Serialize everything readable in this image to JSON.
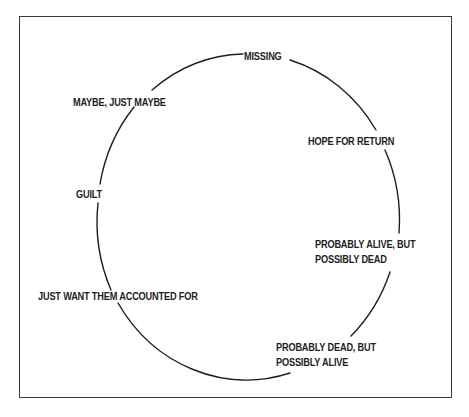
{
  "diagram": {
    "type": "cycle",
    "stroke_color": "#1e1e1e",
    "border_color": "#3a3a3a",
    "stages": [
      {
        "id": "missing",
        "lines": [
          "MISSING"
        ]
      },
      {
        "id": "hope-for-return",
        "lines": [
          "HOPE FOR RETURN"
        ]
      },
      {
        "id": "probably-alive",
        "lines": [
          "PROBABLY ALIVE, BUT",
          "POSSIBLY DEAD"
        ]
      },
      {
        "id": "probably-dead",
        "lines": [
          "PROBABLY DEAD, BUT",
          "POSSIBLY ALIVE"
        ]
      },
      {
        "id": "just-want-accounted",
        "lines": [
          "JUST WANT THEM ACCOUNTED FOR"
        ]
      },
      {
        "id": "guilt",
        "lines": [
          "GUILT"
        ]
      },
      {
        "id": "maybe-just-maybe",
        "lines": [
          "MAYBE, JUST MAYBE"
        ]
      }
    ]
  }
}
